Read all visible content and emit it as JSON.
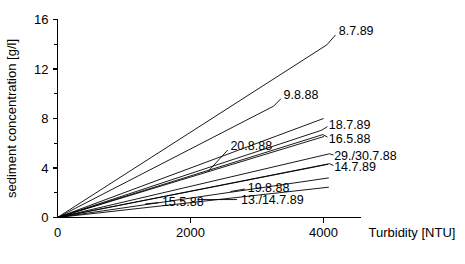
{
  "chart_data": {
    "type": "line",
    "title": "",
    "xlabel": "Turbidity [NTU]",
    "ylabel": "sediment concentration [g/l]",
    "xlim": [
      0,
      4800
    ],
    "ylim": [
      0,
      16
    ],
    "xticks": [
      0,
      2000,
      4000
    ],
    "xtick_labels": [
      "0",
      "2000",
      "4000"
    ],
    "x_minor_ticks": [
      1000,
      3000
    ],
    "yticks": [
      0,
      4,
      8,
      12,
      16
    ],
    "ytick_labels": [
      "0",
      "4",
      "8",
      "12",
      "16"
    ],
    "y_minor_ticks": [
      2,
      6,
      10,
      14
    ],
    "grid": false,
    "legend": "inline-labels",
    "note": "All regression lines pass through the origin; values are endpoint coordinates read off the axes.",
    "series": [
      {
        "name": "8.7.89",
        "label": "8.7.89",
        "slope_g_per_l_per_ntu": 0.00345,
        "x": [
          0,
          4050
        ],
        "y": [
          0,
          13.95
        ],
        "label_x": 4230,
        "label_y": 15.1,
        "leader": {
          "x1": 4050,
          "y1": 13.95,
          "x2": 4180,
          "y2": 14.75
        }
      },
      {
        "name": "9.8.88",
        "label": "9.8.88",
        "slope_g_per_l_per_ntu": 0.00277,
        "x": [
          0,
          3250
        ],
        "y": [
          0,
          9.0
        ],
        "label_x": 3400,
        "label_y": 9.9,
        "leader": {
          "x1": 3250,
          "y1": 9.0,
          "x2": 3360,
          "y2": 9.6
        }
      },
      {
        "name": "18.7.89",
        "label": "18.7.89",
        "slope_g_per_l_per_ntu": 0.00178,
        "x": [
          0,
          3970
        ],
        "y": [
          0,
          7.05
        ],
        "label_x": 4080,
        "label_y": 7.55,
        "leader": {
          "x1": 3970,
          "y1": 7.05,
          "x2": 4060,
          "y2": 7.35
        }
      },
      {
        "name": "16.5.88",
        "label": "16.5.88",
        "slope_g_per_l_per_ntu": 0.00168,
        "x": [
          0,
          3990
        ],
        "y": [
          0,
          6.7
        ],
        "label_x": 4080,
        "label_y": 6.35,
        "leader": {
          "x1": 3990,
          "y1": 6.7,
          "x2": 4060,
          "y2": 6.5
        }
      },
      {
        "name": "29./30.7.88",
        "label": "29./30.7.88",
        "slope_g_per_l_per_ntu": 0.00126,
        "x": [
          0,
          4090
        ],
        "y": [
          0,
          5.15
        ],
        "label_x": 4160,
        "label_y": 5.0,
        "leader": {
          "x1": 4090,
          "y1": 5.15,
          "x2": 4150,
          "y2": 5.05
        }
      },
      {
        "name": "14.7.89",
        "label": "14.7.89",
        "slope_g_per_l_per_ntu": 0.00106,
        "x": [
          0,
          4090
        ],
        "y": [
          0,
          4.35
        ],
        "label_x": 4160,
        "label_y": 4.15,
        "leader": {
          "x1": 4090,
          "y1": 4.35,
          "x2": 4150,
          "y2": 4.2
        }
      },
      {
        "name": "20.8.88",
        "label": "20.8.88",
        "slope_g_per_l_per_ntu": 0.00163,
        "x": [
          0,
          4010
        ],
        "y": [
          0,
          6.55
        ],
        "label_x": 2600,
        "label_y": 5.8,
        "leader": {
          "x1": 2260,
          "y1": 3.7,
          "x2": 2560,
          "y2": 5.45
        }
      },
      {
        "name": "19.8.88",
        "label": "19.8.88",
        "slope_g_per_l_per_ntu": 0.00105,
        "x": [
          0,
          4070
        ],
        "y": [
          0,
          4.3
        ],
        "label_x": 2860,
        "label_y": 2.45,
        "leader": {
          "x1": 2600,
          "y1": 2.1,
          "x2": 2820,
          "y2": 2.3
        }
      },
      {
        "name": "13./14.7.89",
        "label": "13./14.7.89",
        "slope_g_per_l_per_ntu": 0.00078,
        "x": [
          0,
          4080
        ],
        "y": [
          0,
          3.2
        ],
        "label_x": 2760,
        "label_y": 1.45,
        "leader": {
          "x1": 2110,
          "y1": 1.45,
          "x2": 2700,
          "y2": 1.45
        }
      },
      {
        "name": "15.5.88",
        "label": "15.5.88",
        "slope_g_per_l_per_ntu": 0.0006,
        "x": [
          0,
          4080
        ],
        "y": [
          0,
          2.45
        ],
        "label_x": 1570,
        "label_y": 1.3,
        "leader": {
          "x1": 1320,
          "y1": 1.1,
          "x2": 1520,
          "y2": 1.2
        }
      },
      {
        "name": "unlabeled-steep-b",
        "label": "",
        "slope_g_per_l_per_ntu": 0.002,
        "x": [
          0,
          4000
        ],
        "y": [
          0,
          8.0
        ],
        "label_x": null,
        "label_y": null,
        "leader": null
      }
    ]
  }
}
